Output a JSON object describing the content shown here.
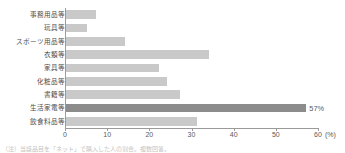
{
  "chart_data": {
    "type": "bar",
    "orientation": "horizontal",
    "title": "",
    "xlabel": "(%)",
    "ylabel": "",
    "xlim": [
      0,
      60
    ],
    "xticks": [
      0,
      10,
      20,
      30,
      40,
      50,
      60
    ],
    "xtick_labels": [
      "0",
      "10",
      "20",
      "30",
      "40",
      "50",
      "60"
    ],
    "grid": false,
    "legend": false,
    "categories": [
      "事務用品等",
      "玩具等",
      "スポーツ用品等",
      "衣類等",
      "家具等",
      "化粧品等",
      "書籍等",
      "生活家電等",
      "飲食料品等"
    ],
    "values": [
      7,
      5,
      14,
      34,
      22,
      24,
      27,
      57,
      31
    ],
    "data_labels": [
      "",
      "",
      "",
      "",
      "",
      "",
      "",
      "57%",
      ""
    ],
    "highlight_index": 7,
    "colors": {
      "bar": "#c9c9c9",
      "bar_highlight": "#8c8c8c",
      "axis": "#9a9a9a",
      "text": "#4d4d4d"
    }
  },
  "axis": {
    "unit_label": "(%)"
  },
  "footnote": {
    "text": "（注）当該品目を「ネット」で購入した人の割合。複数回答。"
  }
}
